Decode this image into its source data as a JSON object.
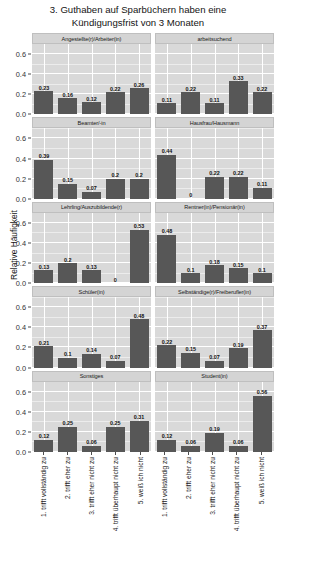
{
  "title": "3. Guthaben auf Sparbüchern haben eine\nKündigungsfrist von 3 Monaten",
  "axes": {
    "ylabel": "Relative Häufigkeit",
    "yticks": [
      "0.0",
      "0.2",
      "0.4",
      "0.6"
    ],
    "ytick_values": [
      0.0,
      0.2,
      0.4,
      0.6
    ],
    "ylim": [
      0,
      0.7
    ],
    "xlabel": "",
    "xticks": [
      "1. trifft vollständig zu",
      "2. trifft eher zu",
      "3. trifft eher nicht zu",
      "4. trifft überhaupt nicht zu",
      "5. weiß ich nicht"
    ]
  },
  "colors": {
    "bar": "#575757",
    "panel": "#d9d9d9",
    "strip": "#d4d4d4",
    "grid": "#ffffff",
    "text": "#141414"
  },
  "chart_data": {
    "type": "bar",
    "title": "3. Guthaben auf Sparbüchern haben eine Kündigungsfrist von 3 Monaten",
    "xlabel": "",
    "ylabel": "Relative Häufigkeit",
    "ylim": [
      0,
      0.7
    ],
    "grid": true,
    "legend": "none",
    "facet_layout": "5 rows x 2 columns",
    "categories": [
      "1. trifft vollständig zu",
      "2. trifft eher zu",
      "3. trifft eher nicht zu",
      "4. trifft überhaupt nicht zu",
      "5. weiß ich nicht"
    ],
    "panels": [
      {
        "label": "Angestellte(r)/Arbeiter(in)",
        "values": [
          0.23,
          0.16,
          0.12,
          0.22,
          0.26
        ],
        "labels": [
          "0.23",
          "0.16",
          "0.12",
          "0.22",
          "0.26"
        ]
      },
      {
        "label": "arbeitsuchend",
        "values": [
          0.11,
          0.22,
          0.11,
          0.33,
          0.22
        ],
        "labels": [
          "0.11",
          "0.22",
          "0.11",
          "0.33",
          "0.22"
        ]
      },
      {
        "label": "Beamter/-in",
        "values": [
          0.39,
          0.15,
          0.07,
          0.2,
          0.2
        ],
        "labels": [
          "0.39",
          "0.15",
          "0.07",
          "0.2",
          "0.2"
        ]
      },
      {
        "label": "Hausfrau/Hausmann",
        "values": [
          0.44,
          0,
          0.22,
          0.22,
          0.11
        ],
        "labels": [
          "0.44",
          "0",
          "0.22",
          "0.22",
          "0.11"
        ]
      },
      {
        "label": "Lehrling/Auszubildende(r)",
        "values": [
          0.13,
          0.2,
          0.13,
          0,
          0.53
        ],
        "labels": [
          "0.13",
          "0.2",
          "0.13",
          "0",
          "0.53"
        ]
      },
      {
        "label": "Rentner(in)/Pensionär(in)",
        "values": [
          0.48,
          0.1,
          0.18,
          0.15,
          0.1
        ],
        "labels": [
          "0.48",
          "0.1",
          "0.18",
          "0.15",
          "0.1"
        ]
      },
      {
        "label": "Schüler(in)",
        "values": [
          0.21,
          0.1,
          0.14,
          0.07,
          0.48
        ],
        "labels": [
          "0.21",
          "0.1",
          "0.14",
          "0.07",
          "0.48"
        ]
      },
      {
        "label": "Selbständige(r)/Freiberufler(in)",
        "values": [
          0.22,
          0.15,
          0.07,
          0.19,
          0.37
        ],
        "labels": [
          "0.22",
          "0.15",
          "0.07",
          "0.19",
          "0.37"
        ]
      },
      {
        "label": "Sonstiges",
        "values": [
          0.12,
          0.25,
          0.06,
          0.25,
          0.31
        ],
        "labels": [
          "0.12",
          "0.25",
          "0.06",
          "0.25",
          "0.31"
        ]
      },
      {
        "label": "Student(in)",
        "values": [
          0.12,
          0.06,
          0.19,
          0.06,
          0.56
        ],
        "labels": [
          "0.12",
          "0.06",
          "0.19",
          "0.06",
          "0.56"
        ]
      }
    ]
  }
}
